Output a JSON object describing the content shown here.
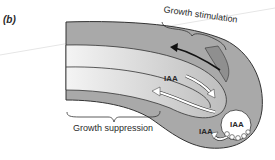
{
  "figure": {
    "panel_label": "(b)",
    "labels": {
      "growth_stimulation": "Growth stimulation",
      "growth_suppression": "Growth suppression",
      "iaa_upper": "IAA",
      "iaa_lower": "IAA",
      "iaa_statocyte": "IAA"
    },
    "colors": {
      "outer_tissue": "#a9a9a9",
      "inner_band_light": "#ececec",
      "inner_band_mid": "#c9c9c9",
      "outline": "#333333",
      "arrow_dark": "#111111",
      "arrow_white": "#ffffff"
    }
  }
}
